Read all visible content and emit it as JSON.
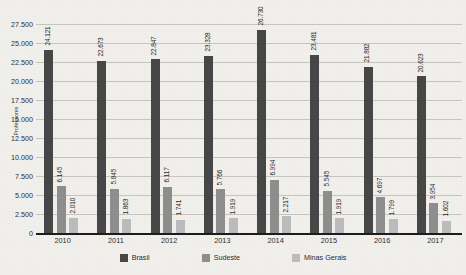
{
  "chart_data": {
    "type": "bar",
    "title": "",
    "subtitle": "",
    "xlabel": "",
    "ylabel": "Professores",
    "ylim": [
      0,
      27500
    ],
    "ytick_step": 2500,
    "ytick_labels": [
      "27.500",
      "25.000",
      "22.500",
      "20.000",
      "17.500",
      "15.000",
      "12.500",
      "10.000",
      "7.500",
      "5.000",
      "2.500",
      "0"
    ],
    "ytick_values": [
      27500,
      25000,
      22500,
      20000,
      17500,
      15000,
      12500,
      10000,
      7500,
      5000,
      2500,
      0
    ],
    "grid": true,
    "legend_position": "bottom",
    "categories": [
      "2010",
      "2011",
      "2012",
      "2013",
      "2014",
      "2015",
      "2016",
      "2017"
    ],
    "series": [
      {
        "name": "Brasil",
        "color": "#474747",
        "values": [
          24121,
          22673,
          22847,
          23328,
          26730,
          23481,
          21882,
          20623
        ],
        "labels": [
          "24.121",
          "22.673",
          "22.847",
          "23.328",
          "26.730",
          "23.481",
          "21.882",
          "20.623"
        ]
      },
      {
        "name": "Sudeste",
        "color": "#8f8f8f",
        "values": [
          6145,
          5845,
          6117,
          5766,
          6994,
          5545,
          4697,
          3954
        ],
        "labels": [
          "6.145",
          "5.845",
          "6.117",
          "5.766",
          "6.994",
          "5.545",
          "4.697",
          "3.954"
        ]
      },
      {
        "name": "Minas Gerais",
        "color": "#bdbdbd",
        "values": [
          2010,
          1863,
          1741,
          1919,
          2217,
          1919,
          1799,
          1602
        ],
        "labels": [
          "2.010",
          "1.863",
          "1.741",
          "1.919",
          "2.217",
          "1.919",
          "1.799",
          "1.602"
        ]
      }
    ]
  }
}
